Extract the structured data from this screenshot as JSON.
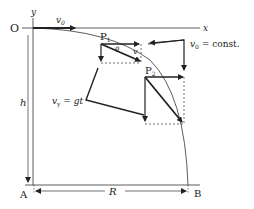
{
  "figure": {
    "labels": {
      "origin": "O",
      "y_axis": "y",
      "x_axis": "x",
      "vx_top": "v",
      "vx_top_sub": "0",
      "p1": "P",
      "p1_sub": "1",
      "p2": "P",
      "p2_sub": "2",
      "theta": "θ",
      "v_small": "v",
      "vx_const": "v",
      "vx_const_sub": "0",
      "vx_const_rest": " = const.",
      "vy": "v",
      "vy_sub": "y",
      "vy_rest": " = gt",
      "height": "h",
      "point_a": "A",
      "range": "R",
      "point_b": "B"
    }
  }
}
